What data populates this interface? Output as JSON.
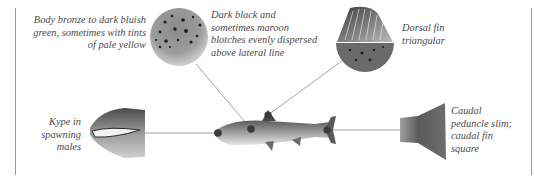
{
  "diagram": {
    "callouts": [
      {
        "id": "body-color",
        "lines": [
          "Body bronze to dark bluish",
          "green, sometimes with tints",
          "of pale yellow"
        ]
      },
      {
        "id": "blotches",
        "lines": [
          "Dark black and",
          "sometimes maroon",
          "blotches evenly dispersed",
          "above lateral line"
        ]
      },
      {
        "id": "dorsal-fin",
        "lines": [
          "Dorsal fin",
          "triangular"
        ]
      },
      {
        "id": "kype",
        "lines": [
          "Kype in",
          "spawning",
          "males"
        ]
      },
      {
        "id": "caudal",
        "lines": [
          "Caudal",
          "peduncle slim;",
          "caudal fin",
          "square"
        ]
      }
    ],
    "colors": {
      "text": "#4a4a4a",
      "line": "#8a8a8a",
      "marker": "#3a3a3a",
      "frame": "#9a9a9a"
    }
  }
}
